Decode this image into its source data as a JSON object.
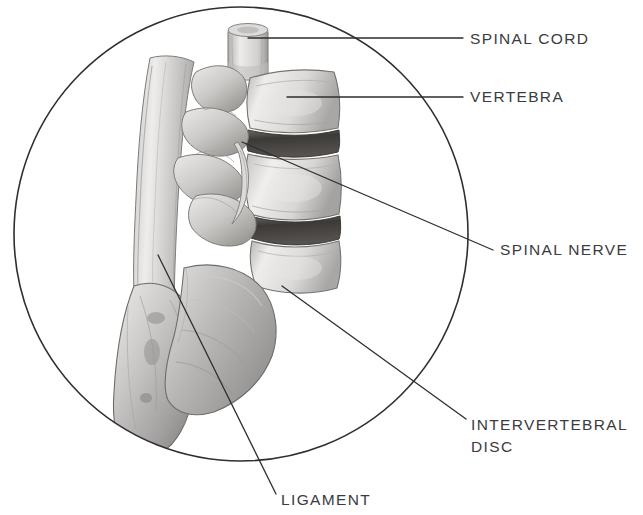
{
  "figure": {
    "style": "grayscale pencil rendering inside a circular frame",
    "background_color": "#ffffff",
    "frame": {
      "shape": "circle",
      "center_x": 241,
      "center_y": 234,
      "radius": 228,
      "stroke_color": "#2e2e33",
      "stroke_width": 1.6,
      "fill": "none"
    },
    "leader_line_color": "#2e2e33",
    "label_color": "#3b3b41"
  },
  "labels": [
    {
      "id": "spinal-cord",
      "text": "SPINAL CORD",
      "text_x": 470,
      "text_y": 28,
      "leader": {
        "x1": 248,
        "y1": 38,
        "x2": 463,
        "y2": 38
      }
    },
    {
      "id": "vertebra",
      "text": "VERTEBRA",
      "text_x": 470,
      "text_y": 86,
      "leader": {
        "x1": 287,
        "y1": 97,
        "x2": 463,
        "y2": 97
      }
    },
    {
      "id": "spinal-nerve",
      "text": "SPINAL NERVE",
      "text_x": 500,
      "text_y": 239,
      "leader": {
        "x1": 242,
        "y1": 142,
        "x2": 493,
        "y2": 250
      }
    },
    {
      "id": "intervertebral-disc",
      "text_line1": "INTERVERTEBRAL",
      "text_line2": "DISC",
      "text_x": 471,
      "text_y": 414,
      "leader": {
        "x1": 282,
        "y1": 286,
        "x2": 466,
        "y2": 419
      }
    },
    {
      "id": "ligament",
      "text": "LIGAMENT",
      "text_x": 281,
      "text_y": 489,
      "leader": {
        "x1": 158,
        "y1": 255,
        "x2": 276,
        "y2": 494
      }
    }
  ],
  "anatomy": {
    "parts": [
      {
        "name": "spinal-cord-stump",
        "description": "cylindrical cord segment at top"
      },
      {
        "name": "vertebral-body-upper",
        "description": "upper lumbar vertebral body"
      },
      {
        "name": "vertebral-body-middle",
        "description": "middle lumbar vertebral body"
      },
      {
        "name": "vertebral-body-lower",
        "description": "lower lumbar vertebral body"
      },
      {
        "name": "intervertebral-disc-upper",
        "description": "dark disc between upper bodies"
      },
      {
        "name": "intervertebral-disc-lower",
        "description": "dark disc between lower bodies"
      },
      {
        "name": "spinous-process-column",
        "description": "posterior processes on the left"
      },
      {
        "name": "facet-joints",
        "description": "articular processes mid-column"
      },
      {
        "name": "sacrum",
        "description": "large triangular sacral bone lower left"
      },
      {
        "name": "ilium-wing",
        "description": "broad iliac surface lower right of sacrum"
      },
      {
        "name": "nerve-root",
        "description": "nerve root emerging between vertebrae"
      }
    ],
    "palette": {
      "bone_light": "#f2f0ee",
      "bone_mid": "#cfcdcb",
      "bone_shade": "#a6a4a3",
      "bone_dark": "#7d7b7a",
      "disc_dark": "#4a4845",
      "outline": "#6e6c6b"
    }
  }
}
